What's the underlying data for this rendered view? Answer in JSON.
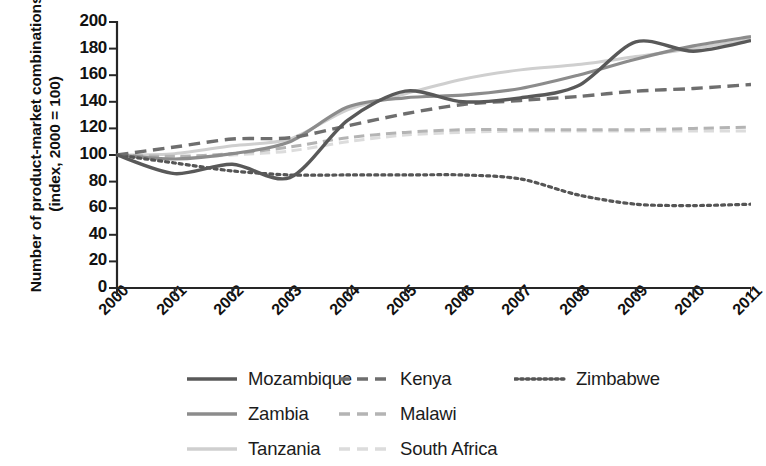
{
  "chart_data": {
    "type": "line",
    "title": "",
    "subtitle": "",
    "xlabel": "",
    "ylabel": "Number of product-market combinations (index, 2000 = 100)",
    "x": [
      2000,
      2001,
      2002,
      2003,
      2004,
      2005,
      2006,
      2007,
      2008,
      2009,
      2010,
      2011
    ],
    "xtick_labels": [
      "2000",
      "2001",
      "2002",
      "2003",
      "2004",
      "2005",
      "2006",
      "2007",
      "2008",
      "2009",
      "2010",
      "2011"
    ],
    "ytick_labels": [
      "0",
      "20",
      "40",
      "60",
      "80",
      "100",
      "120",
      "140",
      "160",
      "180",
      "200"
    ],
    "ylim": [
      0,
      200
    ],
    "xlim": [
      2000,
      2011
    ],
    "ytick_step": 20,
    "grid": false,
    "legend_position": "below-plot",
    "series": [
      {
        "name": "Mozambique",
        "style": "solid",
        "color": "#595959",
        "width": 3.4,
        "values": [
          100,
          86,
          93,
          83,
          126,
          148,
          140,
          143,
          152,
          185,
          178,
          186
        ]
      },
      {
        "name": "Kenya",
        "style": "dashed",
        "color": "#6e6e6e",
        "width": 3.4,
        "values": [
          100,
          106,
          112,
          113,
          122,
          131,
          138,
          141,
          144,
          148,
          150,
          153
        ]
      },
      {
        "name": "Zimbabwe",
        "style": "dotted",
        "color": "#555555",
        "width": 3.2,
        "values": [
          100,
          94,
          88,
          85,
          85,
          85,
          85,
          82,
          70,
          63,
          62,
          63
        ]
      },
      {
        "name": "Zambia",
        "style": "solid",
        "color": "#8c8c8c",
        "width": 3.2,
        "values": [
          100,
          97,
          101,
          110,
          136,
          143,
          145,
          150,
          160,
          172,
          182,
          189
        ]
      },
      {
        "name": "Malawi",
        "style": "dashed",
        "color": "#b4b4b4",
        "width": 3.0,
        "values": [
          100,
          99,
          101,
          106,
          113,
          117,
          119,
          119,
          119,
          119,
          120,
          121
        ]
      },
      {
        "name": "Tanzania",
        "style": "solid",
        "color": "#cfcfcf",
        "width": 3.0,
        "values": [
          100,
          101,
          107,
          112,
          134,
          146,
          157,
          164,
          168,
          174,
          180,
          187
        ]
      },
      {
        "name": "South Africa",
        "style": "dashed",
        "color": "#dcdcdc",
        "width": 3.0,
        "values": [
          100,
          98,
          100,
          103,
          110,
          115,
          117,
          118,
          118,
          118,
          118,
          118
        ]
      }
    ],
    "legend": [
      {
        "label": "Mozambique",
        "style": "solid",
        "color": "#595959"
      },
      {
        "label": "Kenya",
        "style": "dashed",
        "color": "#6e6e6e"
      },
      {
        "label": "Zimbabwe",
        "style": "dotted",
        "color": "#555555"
      },
      {
        "label": "Zambia",
        "style": "solid",
        "color": "#8c8c8c"
      },
      {
        "label": "Malawi",
        "style": "dashed",
        "color": "#b4b4b4"
      },
      {
        "label": "Tanzania",
        "style": "solid",
        "color": "#cfcfcf"
      },
      {
        "label": "South Africa",
        "style": "dashed",
        "color": "#dcdcdc"
      }
    ]
  },
  "axes": {
    "color": "#262626",
    "plot_left": 117,
    "plot_right": 751,
    "plot_top": 22,
    "plot_bottom": 288
  }
}
